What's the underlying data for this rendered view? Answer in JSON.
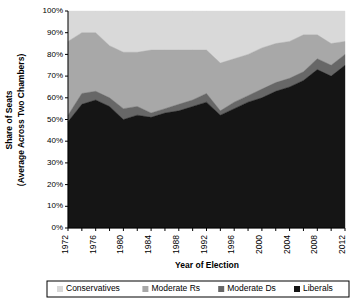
{
  "chart_data": {
    "type": "area",
    "stacked": true,
    "title": "",
    "subtitle": "",
    "xlabel": "Year of Election",
    "ylabel": "Share of Seats\n(Average Across Two Chambers)",
    "ylabel_line1": "Share of Seats",
    "ylabel_line2": "(Average Across Two Chambers)",
    "xlim": [
      1972,
      2012
    ],
    "ylim": [
      0,
      100
    ],
    "grid": false,
    "legend_position": "bottom",
    "y_tick_labels": [
      "0%",
      "10%",
      "20%",
      "30%",
      "40%",
      "50%",
      "60%",
      "70%",
      "80%",
      "90%",
      "100%"
    ],
    "y_tick_values": [
      0,
      10,
      20,
      30,
      40,
      50,
      60,
      70,
      80,
      90,
      100
    ],
    "x_tick_labels": [
      "1972",
      "1976",
      "1980",
      "1984",
      "1988",
      "1992",
      "1996",
      "2000",
      "2004",
      "2008",
      "2012"
    ],
    "x_minor_tick_years": [
      1972,
      1974,
      1976,
      1978,
      1980,
      1982,
      1984,
      1986,
      1988,
      1990,
      1992,
      1994,
      1996,
      1998,
      2000,
      2002,
      2004,
      2006,
      2008,
      2010,
      2012
    ],
    "x": [
      1972,
      1974,
      1976,
      1978,
      1980,
      1982,
      1984,
      1986,
      1988,
      1990,
      1992,
      1994,
      1996,
      1998,
      2000,
      2002,
      2004,
      2006,
      2008,
      2010,
      2012
    ],
    "series": [
      {
        "name": "Liberals",
        "color": "#151515",
        "values": [
          49,
          57,
          59,
          56,
          50,
          52,
          51,
          53,
          54,
          56,
          58,
          52,
          55,
          58,
          60,
          63,
          65,
          68,
          73,
          70,
          75
        ]
      },
      {
        "name": "Moderate Ds",
        "color": "#676767",
        "values": [
          3,
          5,
          4,
          4,
          5,
          4,
          2,
          2,
          3,
          3,
          4,
          2,
          3,
          3,
          4,
          4,
          4,
          4,
          5,
          5,
          5
        ]
      },
      {
        "name": "Moderate Rs",
        "color": "#a8a8a8",
        "values": [
          34,
          28,
          27,
          24,
          26,
          25,
          29,
          27,
          25,
          23,
          20,
          22,
          20,
          19,
          19,
          18,
          17,
          17,
          11,
          10,
          6
        ]
      },
      {
        "name": "Conservatives",
        "color": "#d9d9d9",
        "values": [
          14,
          10,
          10,
          16,
          19,
          19,
          18,
          18,
          18,
          18,
          18,
          24,
          22,
          20,
          17,
          15,
          14,
          11,
          11,
          15,
          14
        ]
      }
    ],
    "cumulative_tops": {
      "liberals": [
        49,
        57,
        59,
        56,
        50,
        52,
        51,
        53,
        54,
        56,
        58,
        52,
        55,
        58,
        60,
        63,
        65,
        68,
        73,
        70,
        75
      ],
      "moderate_ds": [
        52,
        62,
        63,
        60,
        55,
        56,
        53,
        55,
        57,
        59,
        62,
        54,
        58,
        61,
        64,
        67,
        69,
        72,
        78,
        75,
        80
      ],
      "moderate_rs": [
        86,
        90,
        90,
        84,
        81,
        81,
        82,
        82,
        82,
        82,
        82,
        76,
        78,
        80,
        83,
        85,
        86,
        89,
        89,
        85,
        86
      ],
      "conservatives": [
        100,
        100,
        100,
        100,
        100,
        100,
        100,
        100,
        100,
        100,
        100,
        100,
        100,
        100,
        100,
        100,
        100,
        100,
        100,
        100,
        100
      ]
    },
    "legend_entries": [
      {
        "label": "Conservatives",
        "color": "#d9d9d9"
      },
      {
        "label": "Moderate Rs",
        "color": "#a8a8a8"
      },
      {
        "label": "Moderate Ds",
        "color": "#676767"
      },
      {
        "label": "Liberals",
        "color": "#151515"
      }
    ]
  }
}
